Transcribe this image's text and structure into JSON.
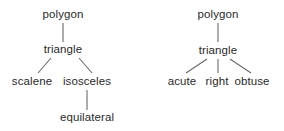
{
  "trees": [
    {
      "root": "polygon",
      "child": "triangle",
      "leaves": [
        "scalene",
        "isosceles"
      ],
      "sub_leaf": "equilateral"
    },
    {
      "root": "polygon",
      "child": "triangle",
      "leaves": [
        "acute",
        "right",
        "obtuse"
      ]
    }
  ],
  "colors": {
    "text": "#2a2a2a",
    "line": "#6a6a6a",
    "background": "#ffffff"
  }
}
